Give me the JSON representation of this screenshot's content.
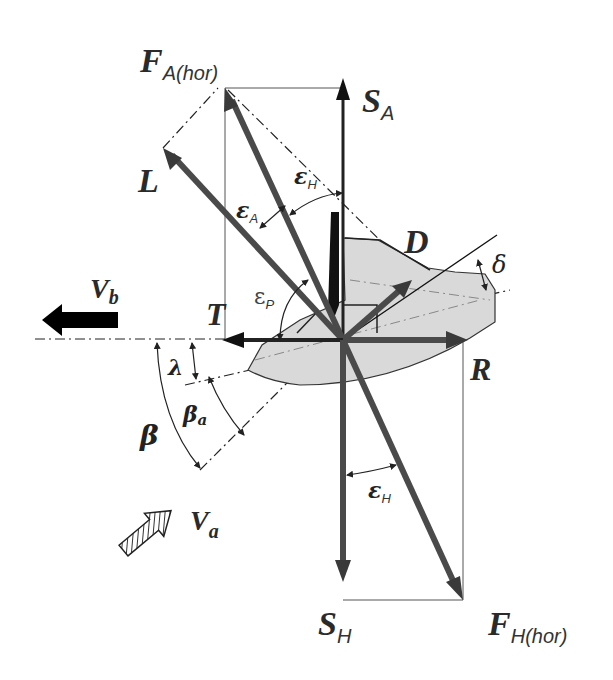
{
  "diagram": {
    "type": "force-vector-diagram",
    "labels": {
      "F_A_hor": {
        "main": "F",
        "sub": "A(hor)"
      },
      "S_A": {
        "main": "S",
        "sub": "A"
      },
      "L": {
        "main": "L"
      },
      "D": {
        "main": "D"
      },
      "T": {
        "main": "T"
      },
      "R": {
        "main": "R"
      },
      "S_H": {
        "main": "S",
        "sub": "H"
      },
      "F_H_hor": {
        "main": "F",
        "sub": "H(hor)"
      },
      "V_b": {
        "main": "V",
        "sub": "b"
      },
      "V_a": {
        "main": "V",
        "sub": "a"
      }
    },
    "angles": {
      "epsilon_A": {
        "main": "ε",
        "sub": "A"
      },
      "epsilon_H_top": {
        "main": "ε",
        "sub": "H"
      },
      "epsilon_P": {
        "main": "ε",
        "sub": "P"
      },
      "epsilon_H_bottom": {
        "main": "ε",
        "sub": "H"
      },
      "delta": {
        "main": "δ"
      },
      "lambda": {
        "main": "λ"
      },
      "beta": {
        "main": "β"
      },
      "beta_a": {
        "main": "β",
        "sub": "a"
      }
    },
    "colors": {
      "vector": "#4a4a4a",
      "hull_fill": "#d9d9d9",
      "line": "#222222",
      "background": "#ffffff"
    }
  }
}
